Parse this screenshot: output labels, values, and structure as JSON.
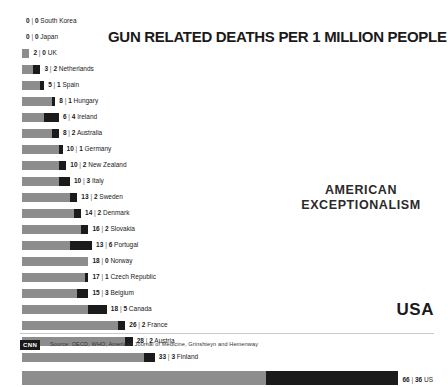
{
  "title": "GUN RELATED DEATHS PER 1 MILLION PEOPLE",
  "annotation_line1": "AMERICAN",
  "annotation_line2": "EXCEPTIONALISM",
  "usa_callout": "USA",
  "brand": "CNN",
  "source": "Source: OECD, WHO, American Journal of Medicine, Grinshteyn and Hemenway",
  "colors": {
    "suicide": "#8d8d8d",
    "homicide": "#1b1b1b",
    "text": "#1a1a1a",
    "background": "#ffffff"
  },
  "chart_data": {
    "type": "bar",
    "orientation": "horizontal",
    "stacked": true,
    "title": "GUN RELATED DEATHS PER 1 MILLION PEOPLE",
    "xlabel": "",
    "ylabel": "",
    "grid": false,
    "legend_position": "none",
    "categories": [
      "South Korea",
      "Japan",
      "UK",
      "Netherlands",
      "Spain",
      "Hungary",
      "Ireland",
      "Australia",
      "Germany",
      "New Zealand",
      "Italy",
      "Sweden",
      "Denmark",
      "Slovakia",
      "Portugal",
      "Norway",
      "Czech Republic",
      "Belgium",
      "Canada",
      "France",
      "Austria",
      "Finland",
      "US"
    ],
    "series": [
      {
        "name": "suicide",
        "values": [
          0,
          0,
          2,
          3,
          5,
          8,
          6,
          8,
          10,
          10,
          10,
          13,
          14,
          16,
          13,
          18,
          17,
          15,
          18,
          26,
          28,
          33,
          66
        ]
      },
      {
        "name": "homicide",
        "values": [
          0,
          0,
          0,
          2,
          1,
          1,
          4,
          2,
          1,
          2,
          3,
          2,
          2,
          2,
          6,
          0,
          1,
          3,
          5,
          2,
          2,
          3,
          36
        ]
      }
    ],
    "xlim": [
      0,
      110
    ],
    "px_per_unit": 3.69
  },
  "rows": [
    {
      "country": "South Korea",
      "suicide": 0,
      "homicide": 0,
      "label": "0 | 0 South Korea"
    },
    {
      "country": "Japan",
      "suicide": 0,
      "homicide": 0,
      "label": "0 | 0 Japan"
    },
    {
      "country": "UK",
      "suicide": 2,
      "homicide": 0,
      "label": "2 | 0 UK"
    },
    {
      "country": "Netherlands",
      "suicide": 3,
      "homicide": 2,
      "label": "3 | 2 Netherlands"
    },
    {
      "country": "Spain",
      "suicide": 5,
      "homicide": 1,
      "label": "5 | 1 Spain"
    },
    {
      "country": "Hungary",
      "suicide": 8,
      "homicide": 1,
      "label": "8 | 1 Hungary"
    },
    {
      "country": "Ireland",
      "suicide": 6,
      "homicide": 4,
      "label": "6 | 4 Ireland"
    },
    {
      "country": "Australia",
      "suicide": 8,
      "homicide": 2,
      "label": "8 | 2 Australia"
    },
    {
      "country": "Germany",
      "suicide": 10,
      "homicide": 1,
      "label": "10 | 1 Germany"
    },
    {
      "country": "New Zealand",
      "suicide": 10,
      "homicide": 2,
      "label": "10 | 2 New Zealand"
    },
    {
      "country": "Italy",
      "suicide": 10,
      "homicide": 3,
      "label": "10 | 3 Italy"
    },
    {
      "country": "Sweden",
      "suicide": 13,
      "homicide": 2,
      "label": "13 | 2 Sweden"
    },
    {
      "country": "Denmark",
      "suicide": 14,
      "homicide": 2,
      "label": "14 | 2 Denmark"
    },
    {
      "country": "Slovakia",
      "suicide": 16,
      "homicide": 2,
      "label": "16 | 2 Slovakia"
    },
    {
      "country": "Portugal",
      "suicide": 13,
      "homicide": 6,
      "label": "13 | 6 Portugal"
    },
    {
      "country": "Norway",
      "suicide": 18,
      "homicide": 0,
      "label": "18 | 0 Norway"
    },
    {
      "country": "Czech Republic",
      "suicide": 17,
      "homicide": 1,
      "label": "17 | 1 Czech Republic"
    },
    {
      "country": "Belgium",
      "suicide": 15,
      "homicide": 3,
      "label": "15 | 3 Belgium"
    },
    {
      "country": "Canada",
      "suicide": 18,
      "homicide": 5,
      "label": "18 | 5 Canada"
    },
    {
      "country": "France",
      "suicide": 26,
      "homicide": 2,
      "label": "26 | 2 France"
    },
    {
      "country": "Austria",
      "suicide": 28,
      "homicide": 2,
      "label": "28 | 2 Austria"
    },
    {
      "country": "Finland",
      "suicide": 33,
      "homicide": 3,
      "label": "33 | 3 Finland"
    }
  ],
  "usa_row": {
    "country": "US",
    "suicide": 66,
    "homicide": 36,
    "label": "66 | 36 US"
  }
}
